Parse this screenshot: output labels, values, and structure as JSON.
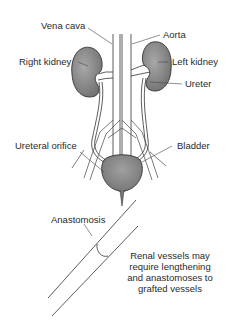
{
  "diagram": {
    "labels": {
      "vena_cava": "Vena cava",
      "aorta": "Aorta",
      "right_kidney": "Right kidney",
      "left_kidney": "Left kidney",
      "ureter": "Ureter",
      "ureteral_orifice": "Ureteral orifice",
      "bladder": "Bladder",
      "anastomosis": "Anastomosis"
    },
    "note_lines": [
      "Renal vessels may",
      "require lengthening",
      "and anastomoses to",
      "grafted vessels"
    ],
    "colors": {
      "organ_fill": "#8a8a8a",
      "line": "#333333",
      "background": "#ffffff"
    }
  }
}
